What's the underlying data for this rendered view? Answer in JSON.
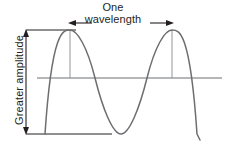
{
  "figure": {
    "type": "wave-diagram",
    "background_color": "#ffffff",
    "stroke_color": "#6d6e71",
    "annotation_color": "#231f20",
    "labels": {
      "wavelength_line1": "One",
      "wavelength_line2": "wavelength",
      "amplitude": "Greater amplitude"
    },
    "annotations": {
      "wavelength_marker": {
        "left_arrow": "arrow-left",
        "right_arrow": "arrow-right",
        "start_x": 70,
        "end_x": 172,
        "y": 23
      },
      "amplitude_marker": {
        "top_arrow": "arrow-up",
        "bottom_arrow": "arrow-down",
        "x": 26,
        "top_y": 30,
        "bottom_y": 134
      }
    },
    "wave": {
      "axis_y": 78,
      "crest_y": 30,
      "trough_y": 134,
      "peak1_x": 70,
      "peak2_x": 172,
      "axis_start_x": 37,
      "axis_end_x": 222
    },
    "guides": {
      "top_reference_line": {
        "x1": 26,
        "x2": 76,
        "y": 30
      },
      "bottom_reference_line": {
        "x1": 26,
        "x2": 112,
        "y": 134
      }
    }
  }
}
